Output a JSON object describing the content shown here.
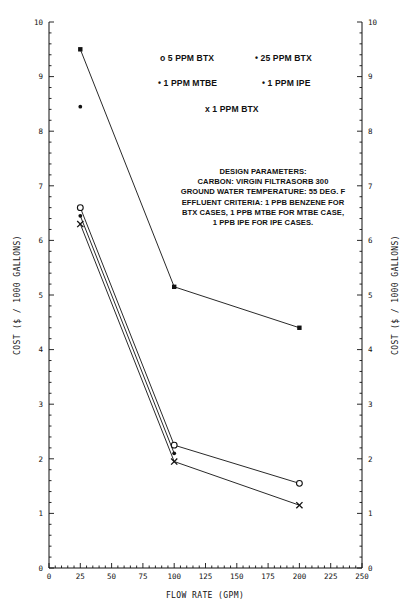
{
  "chart_data": {
    "type": "scatter",
    "title": "",
    "xlabel": "FLOW RATE (GPM)",
    "ylabel": "COST ($ / 1000 GALLONS)",
    "xlim": [
      0,
      250
    ],
    "ylim": [
      0,
      10
    ],
    "xticks": [
      0,
      25,
      50,
      75,
      100,
      125,
      150,
      175,
      200,
      225,
      250
    ],
    "xtick_labels": [
      "0",
      "25",
      "50",
      "75",
      "100",
      "125",
      "150",
      "175",
      "200",
      "225",
      "250"
    ],
    "yticks": [
      0,
      1,
      2,
      3,
      4,
      5,
      6,
      7,
      8,
      9,
      10
    ],
    "ytick_labels": [
      "0",
      "1",
      "2",
      "3",
      "4",
      "5",
      "6",
      "7",
      "8",
      "9",
      "10"
    ],
    "x_minor_step": 5,
    "y_minor_step": 0.2,
    "grid": false,
    "legend_position": "upper-center",
    "series": [
      {
        "name": "5 PPM BTX",
        "marker": "circle-open",
        "line": true,
        "x": [
          25,
          100,
          200
        ],
        "y": [
          6.6,
          2.25,
          1.55
        ]
      },
      {
        "name": "25 PPM BTX",
        "marker": "square-filled",
        "line": true,
        "x": [
          25,
          100,
          200
        ],
        "y": [
          9.5,
          5.15,
          4.4
        ]
      },
      {
        "name": "1 PPM MTBE",
        "marker": "dot",
        "line": false,
        "x": [
          25
        ],
        "y": [
          8.45
        ]
      },
      {
        "name": "1 PPM IPE",
        "marker": "dot",
        "line": true,
        "x": [
          25,
          100
        ],
        "y": [
          6.45,
          2.1
        ]
      },
      {
        "name": "1 PPM BTX",
        "marker": "x",
        "line": true,
        "x": [
          25,
          100,
          200
        ],
        "y": [
          6.3,
          1.95,
          1.15
        ]
      }
    ]
  },
  "legend": {
    "row1": [
      {
        "glyph": "o",
        "label": "5 PPM BTX"
      },
      {
        "glyph": "•",
        "label": "25 PPM BTX"
      }
    ],
    "row2": [
      {
        "glyph": "•",
        "label": "1 PPM MTBE"
      },
      {
        "glyph": "•",
        "label": "1 PPM IPE"
      }
    ],
    "row3": [
      {
        "glyph": "x",
        "label": "1 PPM BTX"
      }
    ],
    "entries_text": {
      "e1": "o 5 PPM BTX",
      "e2": "• 25 PPM BTX",
      "e3": "• 1 PPM MTBE",
      "e4": "• 1 PPM IPE",
      "e5": "x 1 PPM BTX"
    }
  },
  "design_parameters": {
    "heading": "DESIGN PARAMETERS:",
    "lines": [
      "CARBON: VIRGIN FILTRASORB 300",
      "GROUND WATER TEMPERATURE: 55 DEG. F",
      "EFFLUENT CRITERIA: 1 PPB BENZENE FOR",
      "BTX CASES, 1 PPB MTBE FOR MTBE CASE,",
      "1 PPB IPE FOR IPE CASES."
    ],
    "l0": "DESIGN PARAMETERS:",
    "l1": "CARBON: VIRGIN FILTRASORB 300",
    "l2": "GROUND WATER TEMPERATURE: 55 DEG. F",
    "l3": "EFFLUENT CRITERIA: 1 PPB BENZENE FOR",
    "l4": "BTX CASES, 1 PPB MTBE FOR MTBE CASE,",
    "l5": "1 PPB IPE FOR IPE CASES."
  },
  "colors": {
    "ink": "#111111",
    "background": "#ffffff"
  }
}
